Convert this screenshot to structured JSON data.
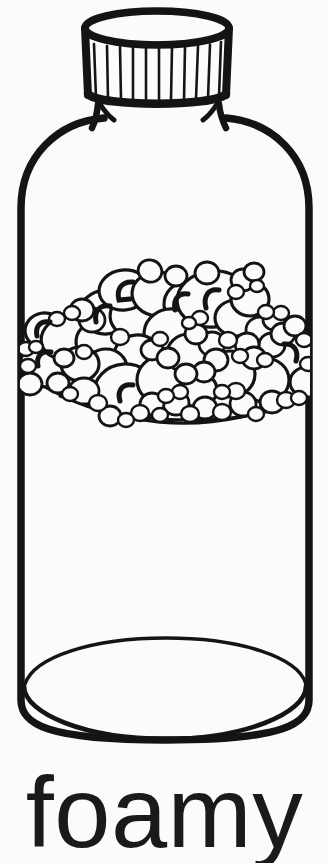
{
  "page": {
    "title": "foamy",
    "background_color": "#fbfbfa",
    "ink_color": "#141414",
    "width": 329,
    "height": 863
  },
  "caption": {
    "text": "foamy"
  },
  "illustration": {
    "kind": "line-drawing",
    "subject": "bottle-with-foam",
    "description": "Black-and-white coloring-book style outline of a capped bottle filled partway with foam bubbles",
    "parts": [
      {
        "name": "bottle-cap",
        "label": "bottle cap",
        "ridge_count": 11
      },
      {
        "name": "bottle-body",
        "label": "bottle body"
      },
      {
        "name": "bottle-base",
        "label": "bottle base"
      },
      {
        "name": "foam-cluster",
        "label": "foam"
      }
    ],
    "cap": {
      "top_ellipse": {
        "cx": 157,
        "cy": 27,
        "rx": 72,
        "ry": 17
      },
      "bottom_ellipse": {
        "cx": 157,
        "cy": 95,
        "rx": 70,
        "ry": 13
      },
      "ridges": [
        {
          "x_top": 92,
          "x_bottom": 94
        },
        {
          "x_top": 105,
          "x_bottom": 106
        },
        {
          "x_top": 118,
          "x_bottom": 119
        },
        {
          "x_top": 131,
          "x_bottom": 132
        },
        {
          "x_top": 144,
          "x_bottom": 144
        },
        {
          "x_top": 157,
          "x_bottom": 157
        },
        {
          "x_top": 170,
          "x_bottom": 170
        },
        {
          "x_top": 183,
          "x_bottom": 182
        },
        {
          "x_top": 196,
          "x_bottom": 195
        },
        {
          "x_top": 209,
          "x_bottom": 207
        },
        {
          "x_top": 221,
          "x_bottom": 219
        }
      ]
    },
    "body": {
      "left_wall_x": 16,
      "right_wall_x": 314,
      "shoulder_top_y": 112,
      "straight_top_y": 205,
      "bottom_y": 742,
      "base_ellipse": {
        "cx": 165,
        "cy": 686,
        "rx": 141,
        "ry": 52
      }
    },
    "foam": {
      "top_y": 272,
      "bottom_y": 424,
      "bubble_count": 96,
      "highlight_count": 8,
      "bubbles": [
        {
          "cx": 46,
          "cy": 360,
          "rx": 26,
          "ry": 24,
          "rot": -8
        },
        {
          "cx": 38,
          "cy": 337,
          "rx": 16,
          "ry": 14,
          "rot": 0
        },
        {
          "cx": 33,
          "cy": 380,
          "rx": 12,
          "ry": 11,
          "rot": 0
        },
        {
          "cx": 62,
          "cy": 333,
          "rx": 27,
          "ry": 22,
          "rot": -12
        },
        {
          "cx": 96,
          "cy": 338,
          "rx": 22,
          "ry": 19,
          "rot": 6
        },
        {
          "cx": 104,
          "cy": 309,
          "rx": 24,
          "ry": 21,
          "rot": -4
        },
        {
          "cx": 133,
          "cy": 314,
          "rx": 26,
          "ry": 22,
          "rot": 10
        },
        {
          "cx": 120,
          "cy": 288,
          "rx": 24,
          "ry": 19,
          "rot": -6
        },
        {
          "cx": 156,
          "cy": 292,
          "rx": 26,
          "ry": 22,
          "rot": 4
        },
        {
          "cx": 186,
          "cy": 302,
          "rx": 25,
          "ry": 23,
          "rot": -3
        },
        {
          "cx": 170,
          "cy": 330,
          "rx": 28,
          "ry": 25,
          "rot": 5
        },
        {
          "cx": 134,
          "cy": 352,
          "rx": 22,
          "ry": 19,
          "rot": -5
        },
        {
          "cx": 105,
          "cy": 365,
          "rx": 20,
          "ry": 18,
          "rot": 0
        },
        {
          "cx": 78,
          "cy": 362,
          "rx": 18,
          "ry": 16,
          "rot": 0
        },
        {
          "cx": 88,
          "cy": 390,
          "rx": 15,
          "ry": 13,
          "rot": 0
        },
        {
          "cx": 120,
          "cy": 388,
          "rx": 17,
          "ry": 15,
          "rot": 0
        },
        {
          "cx": 151,
          "cy": 380,
          "rx": 25,
          "ry": 23,
          "rot": 0
        },
        {
          "cx": 120,
          "cy": 392,
          "rx": 30,
          "ry": 27,
          "rot": 0
        },
        {
          "cx": 186,
          "cy": 352,
          "rx": 22,
          "ry": 20,
          "rot": 0
        },
        {
          "cx": 203,
          "cy": 332,
          "rx": 18,
          "ry": 16,
          "rot": 0
        },
        {
          "cx": 213,
          "cy": 300,
          "rx": 23,
          "ry": 20,
          "rot": 0
        },
        {
          "cx": 230,
          "cy": 313,
          "rx": 22,
          "ry": 19,
          "rot": 0
        },
        {
          "cx": 202,
          "cy": 286,
          "rx": 20,
          "ry": 17,
          "rot": 0
        },
        {
          "cx": 211,
          "cy": 299,
          "rx": 34,
          "ry": 27,
          "rot": -6
        },
        {
          "cx": 248,
          "cy": 298,
          "rx": 19,
          "ry": 17,
          "rot": 0
        },
        {
          "cx": 254,
          "cy": 320,
          "rx": 17,
          "ry": 15,
          "rot": 0
        },
        {
          "cx": 266,
          "cy": 340,
          "rx": 15,
          "ry": 14,
          "rot": 0
        },
        {
          "cx": 286,
          "cy": 355,
          "rx": 24,
          "ry": 22,
          "rot": 0
        },
        {
          "cx": 300,
          "cy": 380,
          "rx": 16,
          "ry": 14,
          "rot": 0
        },
        {
          "cx": 262,
          "cy": 378,
          "rx": 23,
          "ry": 21,
          "rot": 0
        },
        {
          "cx": 228,
          "cy": 372,
          "rx": 24,
          "ry": 22,
          "rot": 0
        },
        {
          "cx": 196,
          "cy": 388,
          "rx": 19,
          "ry": 17,
          "rot": 0
        },
        {
          "cx": 170,
          "cy": 404,
          "rx": 14,
          "ry": 12,
          "rot": 0
        },
        {
          "cx": 208,
          "cy": 406,
          "rx": 13,
          "ry": 11,
          "rot": 0
        },
        {
          "cx": 240,
          "cy": 402,
          "rx": 14,
          "ry": 12,
          "rot": 0
        },
        {
          "cx": 272,
          "cy": 400,
          "rx": 13,
          "ry": 11,
          "rot": 0
        }
      ],
      "highlights": [
        {
          "cx": 41,
          "cy": 355,
          "r": 11,
          "a0": 100,
          "a1": 250
        },
        {
          "cx": 40,
          "cy": 320,
          "r": 10,
          "a0": 110,
          "a1": 260
        },
        {
          "cx": 100,
          "cy": 315,
          "r": 12,
          "a0": 100,
          "a1": 250
        },
        {
          "cx": 122,
          "cy": 383,
          "r": 11,
          "a0": 100,
          "a1": 250
        },
        {
          "cx": 120,
          "cy": 290,
          "r": 12,
          "a0": 100,
          "a1": 255
        },
        {
          "cx": 179,
          "cy": 298,
          "r": 12,
          "a0": 105,
          "a1": 255
        },
        {
          "cx": 215,
          "cy": 299,
          "r": 13,
          "a0": 100,
          "a1": 250
        },
        {
          "cx": 293,
          "cy": 352,
          "r": 12,
          "a0": 295,
          "a1": 80
        }
      ]
    }
  }
}
